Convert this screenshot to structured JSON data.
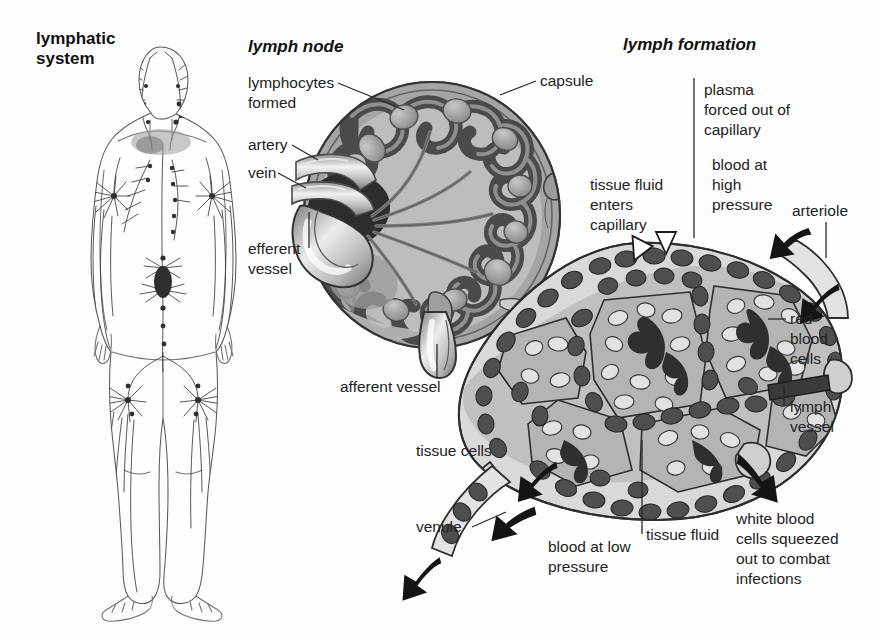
{
  "figure": {
    "background": "#fdfdfd",
    "panels": [
      {
        "id": "lymphatic-system",
        "title": "lymphatic system",
        "title_style": "bold",
        "title_lines": [
          "lymphatic",
          "system"
        ]
      },
      {
        "id": "lymph-node",
        "title": "lymph node",
        "title_style": "bold-italic"
      },
      {
        "id": "lymph-formation",
        "title": "lymph formation",
        "title_style": "bold-italic"
      }
    ]
  },
  "lymph_node_labels": {
    "lymphocytes_formed": [
      "lymphocytes",
      "formed"
    ],
    "artery": "artery",
    "vein": "vein",
    "efferent_vessel": [
      "efferent",
      "vessel"
    ],
    "capsule": "capsule",
    "afferent_vessel": "afferent vessel"
  },
  "lymph_formation_labels": {
    "plasma_forced": [
      "plasma",
      "forced out of",
      "capillary"
    ],
    "tissue_fluid_enters": [
      "tissue fluid",
      "enters",
      "capillary"
    ],
    "blood_high_pressure": [
      "blood at",
      "high",
      "pressure"
    ],
    "arteriole": "arteriole",
    "red_blood_cells": [
      "red",
      "blood",
      "cells"
    ],
    "lymph_vessel": [
      "lymph",
      "vessel"
    ],
    "tissue_cells": "tissue cells",
    "venule": "venule",
    "blood_low_pressure": [
      "blood at low",
      "pressure"
    ],
    "tissue_fluid": "tissue fluid",
    "white_blood_cells": [
      "white blood",
      "cells squeezed",
      "out to combat",
      "infections"
    ]
  },
  "colors": {
    "ink": "#232323",
    "capsule_dark": "#6f6f6f",
    "cortex_mid": "#9a9a9a",
    "sinus_dark": "#4a4a4a",
    "medulla_light": "#b9b9b9",
    "node_pale": "#cfcfcf",
    "tissue_grey": "#a8a8a8",
    "tissue_light": "#d3d3d3",
    "rbc_dark": "#5a5a5a",
    "lymph_cap_dark": "#3c3c3c",
    "body_outline": "#5a5a5a",
    "arrow_black": "#141414",
    "white": "#ffffff"
  }
}
